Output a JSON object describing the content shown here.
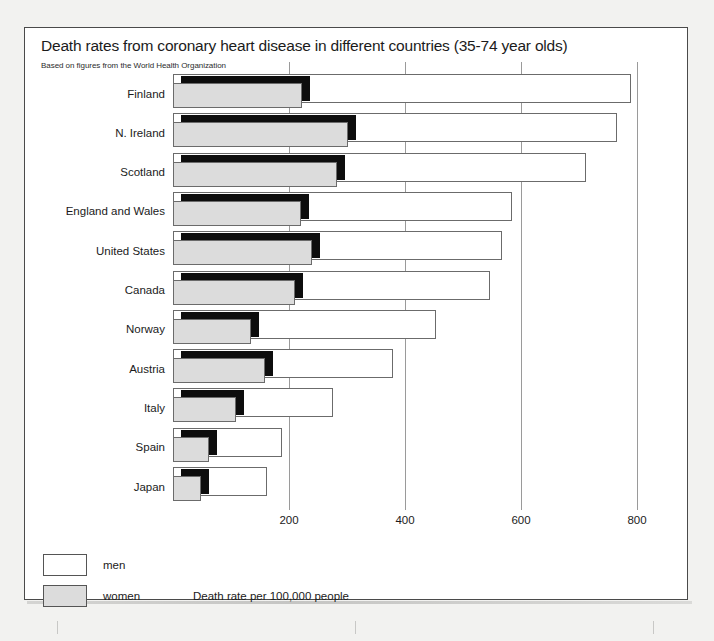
{
  "figure": {
    "title": "Death rates from coronary heart disease in different countries (35-74 year olds)",
    "subtitle": "Based on figures from the World Health Organization"
  },
  "legend": {
    "men_label": "men",
    "women_label": "women",
    "axis_caption": "Death rate per 100,000 people"
  },
  "colors": {
    "men_fill": "#ffffff",
    "women_fill": "#dcdcdc",
    "shadow": "#0d0d0d",
    "outline": "#6b6b6b",
    "gridline": "#9a9a9a",
    "text": "#1b1b1b",
    "page": "#f2f2f0"
  },
  "chart_data": {
    "type": "bar",
    "orientation": "horizontal",
    "title": "Death rates from coronary heart disease in different countries (35-74 year olds)",
    "subtitle": "Based on figures from the World Health Organization",
    "xlabel": "Death rate per 100,000 people",
    "ylabel": "",
    "xlim": [
      0,
      860
    ],
    "xticks": [
      200,
      400,
      600,
      800
    ],
    "xtick_labels": [
      "200",
      "400",
      "600",
      "800"
    ],
    "grid": true,
    "legend_position": "bottom-left",
    "categories": [
      "Finland",
      "N. Ireland",
      "Scotland",
      "England and Wales",
      "United States",
      "Canada",
      "Norway",
      "Austria",
      "Italy",
      "Spain",
      "Japan"
    ],
    "series": [
      {
        "name": "men",
        "values": [
          790,
          765,
          712,
          585,
          567,
          546,
          453,
          380,
          276,
          188,
          162
        ]
      },
      {
        "name": "women",
        "values": [
          222,
          301,
          282,
          220,
          240,
          210,
          134,
          158,
          108,
          62,
          48
        ]
      }
    ]
  }
}
